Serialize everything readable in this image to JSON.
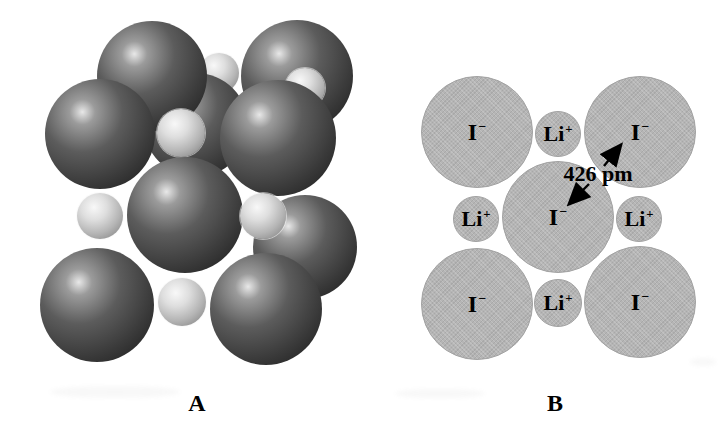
{
  "panel_a": {
    "label": "A",
    "spheres": [
      {
        "kind": "lithium",
        "x": 219,
        "y": 73,
        "r": 20
      },
      {
        "kind": "iodide",
        "x": 196,
        "y": 125,
        "r": 52
      },
      {
        "kind": "iodide",
        "x": 152,
        "y": 76,
        "r": 55
      },
      {
        "kind": "iodide",
        "x": 297,
        "y": 76,
        "r": 56
      },
      {
        "kind": "lithium",
        "x": 305,
        "y": 88,
        "r": 20
      },
      {
        "kind": "lithium",
        "x": 181,
        "y": 133,
        "r": 24
      },
      {
        "kind": "iodide",
        "x": 305,
        "y": 247,
        "r": 52
      },
      {
        "kind": "iodide",
        "x": 100,
        "y": 134,
        "r": 55
      },
      {
        "kind": "iodide",
        "x": 278,
        "y": 138,
        "r": 58
      },
      {
        "kind": "iodide",
        "x": 185,
        "y": 215,
        "r": 58
      },
      {
        "kind": "iodide",
        "x": 97,
        "y": 305,
        "r": 57
      },
      {
        "kind": "iodide",
        "x": 266,
        "y": 309,
        "r": 56
      },
      {
        "kind": "lithium",
        "x": 100,
        "y": 216,
        "r": 23
      },
      {
        "kind": "lithium",
        "x": 263,
        "y": 216,
        "r": 23
      },
      {
        "kind": "lithium",
        "x": 182,
        "y": 302,
        "r": 24
      }
    ]
  },
  "panel_b": {
    "label": "B",
    "annotation": "426 pm",
    "ions": [
      {
        "name": "iodide-ion-top-left",
        "base": "I",
        "charge": "−",
        "x": 476,
        "y": 131,
        "r": 55,
        "size": "large"
      },
      {
        "name": "iodide-ion-top-right",
        "base": "I",
        "charge": "−",
        "x": 639,
        "y": 131,
        "r": 55,
        "size": "large"
      },
      {
        "name": "iodide-ion-center",
        "base": "I",
        "charge": "−",
        "x": 557,
        "y": 216,
        "r": 55,
        "size": "large"
      },
      {
        "name": "iodide-ion-bottom-left",
        "base": "I",
        "charge": "−",
        "x": 476,
        "y": 303,
        "r": 55,
        "size": "large"
      },
      {
        "name": "iodide-ion-bottom-right",
        "base": "I",
        "charge": "−",
        "x": 639,
        "y": 301,
        "r": 55,
        "size": "large"
      },
      {
        "name": "lithium-ion-top",
        "base": "Li",
        "charge": "+",
        "x": 557,
        "y": 133,
        "r": 22,
        "size": "small"
      },
      {
        "name": "lithium-ion-left",
        "base": "Li",
        "charge": "+",
        "x": 475,
        "y": 218,
        "r": 22,
        "size": "small"
      },
      {
        "name": "lithium-ion-right",
        "base": "Li",
        "charge": "+",
        "x": 638,
        "y": 218,
        "r": 22,
        "size": "small"
      },
      {
        "name": "lithium-ion-bottom",
        "base": "Li",
        "charge": "+",
        "x": 557,
        "y": 302,
        "r": 23,
        "size": "small"
      }
    ]
  },
  "colors": {
    "background": "#ffffff",
    "ink": "#000000",
    "iodide_sphere": {
      "highlight": "#e8e8e8",
      "body": "#5c5c5c",
      "edge": "#1f1f1f"
    },
    "lithium_sphere": {
      "highlight": "#f8f8f8",
      "body": "#b4b4b4",
      "edge": "#787878"
    },
    "ion_circle": {
      "fill": "#b5b5b5",
      "edge": "#a2a2a2"
    }
  }
}
